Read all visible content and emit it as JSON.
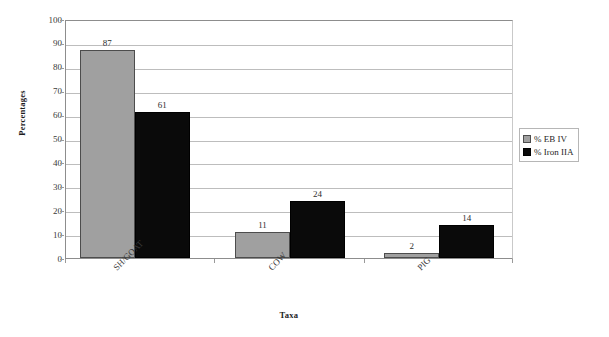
{
  "chart_data": {
    "type": "bar",
    "title": "",
    "xlabel": "Taxa",
    "ylabel": "Percentages",
    "categories": [
      "SH/GOAT",
      "COW",
      "PIG"
    ],
    "series": [
      {
        "name": "% EB IV",
        "values": [
          87,
          11,
          2
        ],
        "color": "#a0a0a0"
      },
      {
        "name": "% Iron IIA",
        "values": [
          61,
          24,
          14
        ],
        "color": "#0a0a0a"
      }
    ],
    "ylim": [
      0,
      100
    ],
    "ytick_step": 10,
    "yticks": [
      "100",
      "90",
      "80",
      "70",
      "60",
      "50",
      "40",
      "30",
      "20",
      "10",
      "0"
    ],
    "grid": true,
    "grid_axis": "y",
    "legend_position": "right",
    "data_labels": true
  },
  "axes": {
    "y_title": "Percentages",
    "x_title": "Taxa"
  },
  "legend": {
    "items": [
      {
        "label": "% EB IV",
        "swatch": "legend-swatch-eb-iv"
      },
      {
        "label": "% Iron IIA",
        "swatch": "legend-swatch-iron-iia"
      }
    ]
  }
}
